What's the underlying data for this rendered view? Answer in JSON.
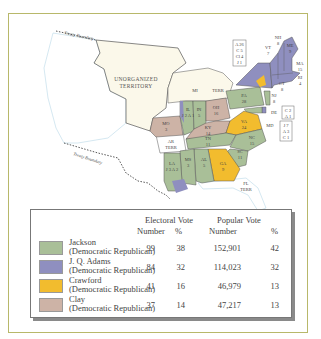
{
  "map": {
    "territory_labels": {
      "unorganized_line1": "UNORGANIZED",
      "unorganized_line2": "TERRITORY",
      "mi": "MI",
      "terr": "TERR",
      "ar": "AR",
      "ar_terr": "TERR",
      "fl": "FL",
      "fl_terr": "TERR"
    },
    "boundary_labels": {
      "north": "Treaty Boundary",
      "south": "Treaty Boundary"
    },
    "states": [
      {
        "abbr": "ME",
        "votes": "9",
        "winner": "adams"
      },
      {
        "abbr": "NH",
        "votes": "8",
        "winner": "adams"
      },
      {
        "abbr": "VT",
        "votes": "7",
        "winner": "adams"
      },
      {
        "abbr": "MA",
        "votes": "15",
        "winner": "adams"
      },
      {
        "abbr": "RI",
        "votes": "4",
        "winner": "adams"
      },
      {
        "abbr": "CT",
        "votes": "8",
        "winner": "adams"
      },
      {
        "abbr": "NJ",
        "votes": "8",
        "winner": "jackson"
      },
      {
        "abbr": "PA",
        "votes": "28",
        "winner": "jackson"
      },
      {
        "abbr": "OH",
        "votes": "16",
        "winner": "clay"
      },
      {
        "abbr": "IN",
        "votes": "5",
        "winner": "jackson"
      },
      {
        "abbr": "IL",
        "votes": "J 2 A 1",
        "winner": "jackson"
      },
      {
        "abbr": "MO",
        "votes": "3",
        "winner": "clay"
      },
      {
        "abbr": "KY",
        "votes": "14",
        "winner": "clay"
      },
      {
        "abbr": "VA",
        "votes": "24",
        "winner": "crawford"
      },
      {
        "abbr": "NC",
        "votes": "15",
        "winner": "jackson"
      },
      {
        "abbr": "SC",
        "votes": "11",
        "winner": "jackson"
      },
      {
        "abbr": "GA",
        "votes": "9",
        "winner": "crawford"
      },
      {
        "abbr": "TN",
        "votes": "11",
        "winner": "jackson"
      },
      {
        "abbr": "AL",
        "votes": "5",
        "winner": "jackson"
      },
      {
        "abbr": "MS",
        "votes": "3",
        "winner": "jackson"
      },
      {
        "abbr": "LA",
        "votes": "J 3 A 2",
        "winner": "jackson"
      },
      {
        "abbr": "DE",
        "votes": "",
        "winner": "adams"
      },
      {
        "abbr": "MD",
        "votes": "",
        "winner": "jackson"
      }
    ],
    "split_boxes": {
      "ny": [
        "A 26",
        "C 5",
        "Cl 4",
        "J 1"
      ],
      "de": [
        "C 2",
        "A 1"
      ],
      "md": [
        "J 7",
        "A 3",
        "C 1"
      ]
    },
    "de_label": "DE",
    "md_label": "MD"
  },
  "legend": {
    "electoral_header": "Electoral Vote",
    "popular_header": "Popular Vote",
    "number_label": "Number",
    "percent_label": "%",
    "rows": [
      {
        "name": "Jackson",
        "party": "(Democratic Republican)",
        "color": "#a9bf98",
        "ev_number": "99",
        "ev_pct": "38",
        "pv_number": "152,901",
        "pv_pct": "42"
      },
      {
        "name": "J. Q. Adams",
        "party": "(Democratic Republican)",
        "color": "#8f8fbf",
        "ev_number": "84",
        "ev_pct": "32",
        "pv_number": "114,023",
        "pv_pct": "32"
      },
      {
        "name": "Crawford",
        "party": "(Democratic Republican)",
        "color": "#f2bc2e",
        "ev_number": "41",
        "ev_pct": "16",
        "pv_number": "46,979",
        "pv_pct": "13"
      },
      {
        "name": "Clay",
        "party": "(Democratic Republican)",
        "color": "#cdb3a6",
        "ev_number": "37",
        "ev_pct": "14",
        "pv_number": "47,217",
        "pv_pct": "13"
      }
    ]
  },
  "colors": {
    "frame": "#b8b86a",
    "jackson": "#a9bf98",
    "adams": "#8f8fbf",
    "crawford": "#f2bc2e",
    "clay": "#cdb3a6",
    "territory": "#fbf8ea",
    "water": "#cfe6f0"
  }
}
